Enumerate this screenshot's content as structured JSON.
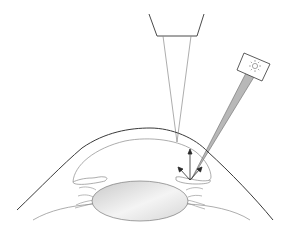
{
  "diagram": {
    "colors": {
      "background": "#ffffff",
      "outline": "#3a3a3a",
      "thin_line": "#8a8a8a",
      "beam_fill": "#b8b8b8",
      "lens_fill_light": "#f4f4f4",
      "lens_fill_dark": "#c9c9c9"
    },
    "elements": [
      {
        "id": "microscope-objective",
        "icon": "objective-trapezoid"
      },
      {
        "id": "observation-cone",
        "icon": "converging-lines"
      },
      {
        "id": "light-source",
        "icon": "sun-icon"
      },
      {
        "id": "light-beam",
        "icon": "tapered-beam"
      },
      {
        "id": "cornea",
        "icon": "curved-outline"
      },
      {
        "id": "anterior-chamber",
        "icon": "chamber-outline"
      },
      {
        "id": "iris",
        "icon": "iris-outline"
      },
      {
        "id": "crystalline-lens",
        "icon": "lens-ellipse"
      },
      {
        "id": "reflection-arrows",
        "count": 3
      }
    ]
  }
}
